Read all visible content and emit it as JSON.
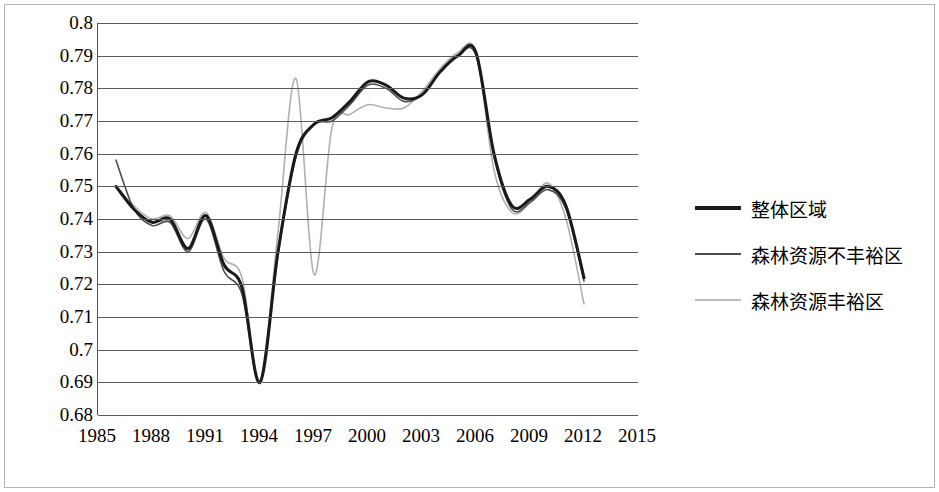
{
  "chart_data": {
    "type": "line",
    "title": "",
    "xlabel": "",
    "ylabel": "",
    "xlim": [
      1985,
      2015
    ],
    "ylim": [
      0.68,
      0.8
    ],
    "ytick_labels": [
      "0.8",
      "0.79",
      "0.78",
      "0.77",
      "0.76",
      "0.75",
      "0.74",
      "0.73",
      "0.72",
      "0.71",
      "0.7",
      "0.69",
      "0.68"
    ],
    "ytick_values": [
      0.8,
      0.79,
      0.78,
      0.77,
      0.76,
      0.75,
      0.74,
      0.73,
      0.72,
      0.71,
      0.7,
      0.69,
      0.68
    ],
    "xtick_labels": [
      "1985",
      "1988",
      "1991",
      "1994",
      "1997",
      "2000",
      "2003",
      "2006",
      "2009",
      "2012",
      "2015"
    ],
    "xtick_values": [
      1985,
      1988,
      1991,
      1994,
      1997,
      2000,
      2003,
      2006,
      2009,
      2012,
      2015
    ],
    "grid": true,
    "legend_position": "right",
    "x": [
      1986,
      1987,
      1988,
      1989,
      1990,
      1991,
      1992,
      1993,
      1994,
      1995,
      1996,
      1997,
      1998,
      1999,
      2000,
      2001,
      2002,
      2003,
      2004,
      2005,
      2006,
      2007,
      2008,
      2009,
      2010,
      2011,
      2012
    ],
    "series": [
      {
        "name": "整体区域",
        "color": "#1a1a1a",
        "width": 3,
        "values": [
          0.75,
          0.743,
          0.739,
          0.74,
          0.731,
          0.741,
          0.726,
          0.719,
          0.69,
          0.73,
          0.76,
          0.769,
          0.771,
          0.776,
          0.782,
          0.781,
          0.777,
          0.778,
          0.785,
          0.79,
          0.791,
          0.76,
          0.744,
          0.746,
          0.75,
          0.744,
          0.722
        ]
      },
      {
        "name": "森林资源不丰裕区",
        "color": "#4d4d4d",
        "width": 1.6,
        "values": [
          0.758,
          0.743,
          0.738,
          0.739,
          0.73,
          0.74,
          0.724,
          0.717,
          0.69,
          0.729,
          0.759,
          0.769,
          0.77,
          0.775,
          0.781,
          0.78,
          0.776,
          0.778,
          0.785,
          0.79,
          0.79,
          0.759,
          0.743,
          0.745,
          0.749,
          0.743,
          0.721
        ]
      },
      {
        "name": "森林资源丰裕区",
        "color": "#b0b0b0",
        "width": 1.6,
        "values": [
          0.75,
          0.744,
          0.74,
          0.741,
          0.734,
          0.742,
          0.728,
          0.722,
          0.69,
          0.736,
          0.783,
          0.723,
          0.768,
          0.772,
          0.775,
          0.774,
          0.774,
          0.779,
          0.786,
          0.791,
          0.791,
          0.755,
          0.742,
          0.745,
          0.751,
          0.74,
          0.714
        ]
      }
    ]
  },
  "legend": {
    "items": [
      {
        "label": "整体区域",
        "color": "#1a1a1a",
        "width": 4
      },
      {
        "label": "森林资源不丰裕区",
        "color": "#4d4d4d",
        "width": 2
      },
      {
        "label": "森林资源丰裕区",
        "color": "#bdbdbd",
        "width": 2
      }
    ]
  }
}
